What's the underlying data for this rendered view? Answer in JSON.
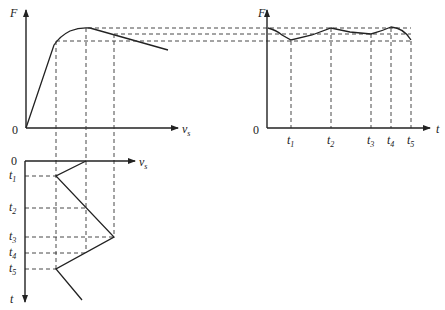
{
  "diagram": {
    "top_left_plot": {
      "y_axis_label": "F",
      "x_axis_label": "v",
      "x_axis_label_sub": "s",
      "origin_label": "0"
    },
    "top_right_plot": {
      "y_axis_label": "F",
      "x_axis_label": "t",
      "origin_label": "0",
      "ticks": [
        {
          "label": "t",
          "sub": "1"
        },
        {
          "label": "t",
          "sub": "2"
        },
        {
          "label": "t",
          "sub": "3"
        },
        {
          "label": "t",
          "sub": "4"
        },
        {
          "label": "t",
          "sub": "5"
        }
      ]
    },
    "bottom_plot": {
      "x_axis_label": "v",
      "x_axis_label_sub": "s",
      "y_axis_label": "t",
      "origin_label": "0",
      "ticks": [
        {
          "label": "t",
          "sub": "1"
        },
        {
          "label": "t",
          "sub": "2"
        },
        {
          "label": "t",
          "sub": "3"
        },
        {
          "label": "t",
          "sub": "4"
        },
        {
          "label": "t",
          "sub": "5"
        }
      ]
    },
    "colors": {
      "line": "#222222",
      "dash": "#333333",
      "background": "#ffffff"
    }
  }
}
